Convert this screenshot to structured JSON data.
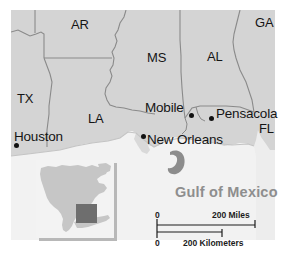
{
  "figure": {
    "width": 286,
    "height": 254
  },
  "colors": {
    "land": "#d4d4d4",
    "water": "#efefef",
    "ocean_deep": "#e9e9e9",
    "border_line": "#8a8a8a",
    "coast_line": "#c2c2c2",
    "label_text": "#141414",
    "gulf_text": "#8e8e8e",
    "inset_land": "#c6c6c6",
    "inset_water": "#f1f1f1",
    "inset_highlight": "#6e6e6e",
    "inset_shadow": "#b8b8b8",
    "city_dot": "#111111",
    "scale_line": "#1c1c1c",
    "island": "#8c8c8c"
  },
  "states": [
    {
      "abbr": "AR",
      "name": "Arkansas",
      "x": 71,
      "y": 18
    },
    {
      "abbr": "GA",
      "name": "Georgia",
      "x": 255,
      "y": 16
    },
    {
      "abbr": "MS",
      "name": "Mississippi",
      "x": 147,
      "y": 51
    },
    {
      "abbr": "AL",
      "name": "Alabama",
      "x": 207,
      "y": 50
    },
    {
      "abbr": "TX",
      "name": "Texas",
      "x": 17,
      "y": 92
    },
    {
      "abbr": "LA",
      "name": "Louisiana",
      "x": 88,
      "y": 112
    },
    {
      "abbr": "FL",
      "name": "Florida",
      "x": 259,
      "y": 122
    }
  ],
  "cities": [
    {
      "name": "Mobile",
      "label_x": 145,
      "label_y": 101,
      "dot_x": 189,
      "dot_y": 113
    },
    {
      "name": "Pensacola",
      "label_x": 216,
      "label_y": 107,
      "dot_x": 209,
      "dot_y": 116
    },
    {
      "name": "New Orleans",
      "label_x": 147,
      "label_y": 133,
      "dot_x": 141,
      "dot_y": 134
    },
    {
      "name": "Houston",
      "label_x": 14,
      "label_y": 130,
      "dot_x": 14,
      "dot_y": 143
    }
  ],
  "water_body": {
    "label": "Gulf of Mexico",
    "x": 175,
    "y": 190
  },
  "scale_bar": {
    "miles": {
      "zero_label": "0",
      "max_label": "200 Miles",
      "value": 200,
      "unit": "Miles"
    },
    "kilometers": {
      "zero_label": "0",
      "max_label": "200 Kilometers",
      "value": 200,
      "unit": "Kilometers"
    }
  },
  "inset": {
    "name": "north-america-locator",
    "region": "North America",
    "x": 36,
    "y": 160,
    "width": 78,
    "height": 78
  }
}
